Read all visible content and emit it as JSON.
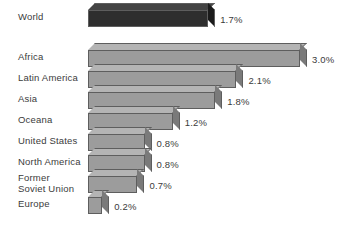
{
  "chart_data": {
    "type": "bar",
    "orientation": "horizontal",
    "title": "",
    "subtitle": "",
    "xlabel": "",
    "ylabel": "",
    "grid": false,
    "legend": "none",
    "xlim": [
      0,
      3.0
    ],
    "value_suffix": "%",
    "categories": [
      "World",
      "Africa",
      "Latin America",
      "Asia",
      "Oceana",
      "United States",
      "North America",
      "Former\nSoviet Union",
      "Europe"
    ],
    "values": [
      1.7,
      3.0,
      2.1,
      1.8,
      1.2,
      0.8,
      0.8,
      0.7,
      0.2
    ],
    "value_labels": [
      "1.7%",
      "3.0%",
      "2.1%",
      "1.8%",
      "1.2%",
      "0.8%",
      "0.8%",
      "0.7%",
      "0.2%"
    ],
    "bars": [
      {
        "label": "World",
        "value": 1.7,
        "value_label": "1.7%",
        "group": "world"
      },
      {
        "label": "Africa",
        "value": 3.0,
        "value_label": "3.0%",
        "group": "region"
      },
      {
        "label": "Latin America",
        "value": 2.1,
        "value_label": "2.1%",
        "group": "region"
      },
      {
        "label": "Asia",
        "value": 1.8,
        "value_label": "1.8%",
        "group": "region"
      },
      {
        "label": "Oceana",
        "value": 1.2,
        "value_label": "1.2%",
        "group": "region"
      },
      {
        "label": "United States",
        "value": 0.8,
        "value_label": "0.8%",
        "group": "region"
      },
      {
        "label": "North America",
        "value": 0.8,
        "value_label": "0.8%",
        "group": "region"
      },
      {
        "label": "Former\nSoviet Union",
        "value": 0.7,
        "value_label": "0.7%",
        "group": "region"
      },
      {
        "label": "Europe",
        "value": 0.2,
        "value_label": "0.2%",
        "group": "region"
      }
    ]
  },
  "colors": {
    "background": "#ffffff",
    "world_bar_front": "#2e2e2e",
    "world_bar_top": "#444444",
    "world_bar_side": "#1b1b1b",
    "region_bar_front": "#9c9c9c",
    "region_bar_top": "#b4b4b4",
    "region_bar_side": "#7a7a7a",
    "bar_outline": "#5e5e5e",
    "text": "#3b3b3b"
  }
}
